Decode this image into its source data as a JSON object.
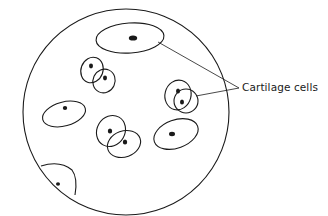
{
  "diagram": {
    "type": "biology-illustration",
    "labels": [
      {
        "id": "cartilage-cells",
        "text": "Cartilage cells"
      }
    ],
    "colors": {
      "stroke": "#1a1a1a",
      "background": "#ffffff"
    }
  }
}
